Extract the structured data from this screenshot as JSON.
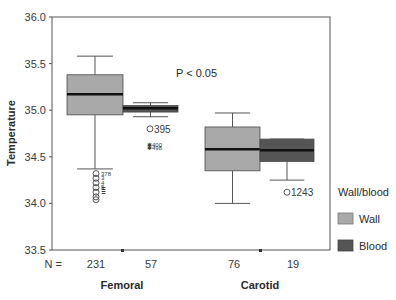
{
  "chart_data": {
    "type": "boxplot",
    "title": "",
    "xlabel": "",
    "ylabel": "Temperature",
    "ylim": [
      33.5,
      36.0
    ],
    "yticks": [
      "36.0",
      "35.5",
      "35.0",
      "34.5",
      "34.0",
      "33.5"
    ],
    "annotation": "P < 0.05",
    "n_label": "N =",
    "categories": [
      "Femoral",
      "Carotid"
    ],
    "legend": {
      "title": "Wall/blood",
      "entries": [
        {
          "name": "Wall",
          "color": "#a9a9a9"
        },
        {
          "name": "Blood",
          "color": "#555555"
        }
      ]
    },
    "series": [
      {
        "name": "Wall",
        "color": "#a9a9a9",
        "boxes": [
          {
            "category": "Femoral",
            "n": "231",
            "whisker_low": 34.37,
            "q1": 34.95,
            "median": 35.17,
            "q3": 35.38,
            "whisker_high": 35.58,
            "outliers": [
              34.32,
              34.27,
              34.22,
              34.17,
              34.12,
              34.07,
              34.04
            ],
            "outlier_labels": [
              "378",
              "3",
              "4",
              "5"
            ]
          },
          {
            "category": "Carotid",
            "n": "76",
            "whisker_low": 34.0,
            "q1": 34.35,
            "median": 34.58,
            "q3": 34.82,
            "whisker_high": 34.97,
            "outliers": [],
            "outlier_labels": []
          }
        ]
      },
      {
        "name": "Blood",
        "color": "#555555",
        "boxes": [
          {
            "category": "Femoral",
            "n": "57",
            "whisker_low": 34.93,
            "q1": 34.98,
            "median": 35.02,
            "q3": 35.05,
            "whisker_high": 35.08,
            "outliers": [
              34.8
            ],
            "outlier_labels": [
              "395"
            ],
            "extremes": [
              34.64,
              34.6
            ],
            "extreme_labels": [
              "400",
              "498"
            ]
          },
          {
            "category": "Carotid",
            "n": "19",
            "whisker_low": 34.25,
            "q1": 34.45,
            "median": 34.57,
            "q3": 34.69,
            "whisker_high": 34.69,
            "outliers": [
              34.12
            ],
            "outlier_labels": [
              "1243"
            ]
          }
        ]
      }
    ]
  }
}
